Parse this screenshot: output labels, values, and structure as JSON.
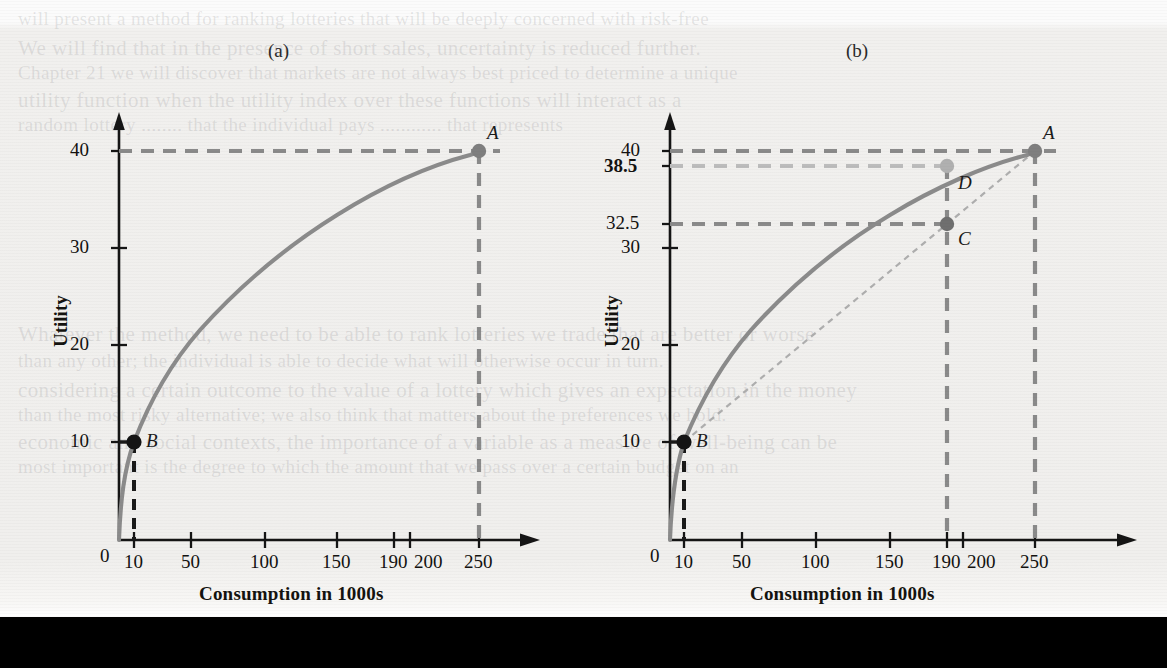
{
  "figure": {
    "background_color": "#f1f0ee",
    "bottom_bar_color": "#000000",
    "ghost_text": [
      {
        "text": "will present a method for ranking lotteries that will be deeply concerned with risk-free",
        "x": 18,
        "y": 8
      },
      {
        "text": "We will find that in the presence of short sales, uncertainty is reduced further.",
        "x": 18,
        "y": 36
      },
      {
        "text": "Chapter 21 we will discover that markets are not always best priced to determine a unique",
        "x": 18,
        "y": 62
      },
      {
        "text": "utility function when the utility index over these functions will interact as a",
        "x": 18,
        "y": 88
      },
      {
        "text": "random lottery  ........  that the individual pays ............ that represents",
        "x": 18,
        "y": 114
      },
      {
        "text": "Whatever the method, we need to be able to rank lotteries we trade that are better or worse",
        "x": 18,
        "y": 322
      },
      {
        "text": "than any other; the individual is able to decide what will otherwise occur in turn.",
        "x": 18,
        "y": 350
      },
      {
        "text": "considering a certain outcome to the value of a lottery which gives an expectation in the money",
        "x": 18,
        "y": 378
      },
      {
        "text": "than the most risky alternative; we also think that matters about the preferences we hold.",
        "x": 18,
        "y": 404
      },
      {
        "text": "economic and social contexts, the importance of a variable as a measure of well-being can be",
        "x": 18,
        "y": 430
      },
      {
        "text": "most important is the degree to which the amount that we pass over a certain budget on an",
        "x": 18,
        "y": 456
      }
    ]
  },
  "chart_data": [
    {
      "type": "line",
      "panel": "(a)",
      "title": "(a)",
      "xlabel": "Consumption in 1000s",
      "ylabel": "Utility",
      "xlim": [
        0,
        275
      ],
      "ylim": [
        0,
        45
      ],
      "grid": false,
      "legend": "none",
      "x_ticks": [
        0,
        10,
        50,
        100,
        150,
        190,
        200,
        250
      ],
      "x_tick_labels": [
        "0",
        "10",
        "50",
        "100",
        "150",
        "190",
        "200",
        "250"
      ],
      "y_ticks": [
        10,
        20,
        30,
        40
      ],
      "y_tick_labels": [
        "10",
        "20",
        "30",
        "40"
      ],
      "curve_color": "#8b8b8b",
      "series": [
        {
          "name": "utility function",
          "x": [
            0,
            2,
            5,
            10,
            20,
            35,
            50,
            75,
            100,
            125,
            150,
            175,
            190,
            200,
            225,
            250
          ],
          "values": [
            0,
            4.5,
            7.2,
            10.0,
            14.3,
            19.0,
            22.5,
            27.0,
            30.4,
            33.2,
            35.4,
            37.3,
            38.3,
            38.9,
            39.6,
            40.0
          ]
        }
      ],
      "points": [
        {
          "label": "B",
          "x": 10,
          "y": 10,
          "color": "#1a1a1a",
          "guides": [
            "horizontal",
            "vertical"
          ],
          "guide_color": "#1a1a1a"
        },
        {
          "label": "A",
          "x": 250,
          "y": 40,
          "color": "#7f7f7f",
          "guides": [
            "horizontal",
            "vertical"
          ],
          "guide_color": "#8a8a8a"
        }
      ],
      "annotations": []
    },
    {
      "type": "line",
      "panel": "(b)",
      "title": "(b)",
      "xlabel": "Consumption in 1000s",
      "ylabel": "Utility",
      "xlim": [
        0,
        275
      ],
      "ylim": [
        0,
        45
      ],
      "grid": false,
      "legend": "none",
      "x_ticks": [
        0,
        10,
        50,
        100,
        150,
        190,
        200,
        250
      ],
      "x_tick_labels": [
        "0",
        "10",
        "50",
        "100",
        "150",
        "190",
        "200",
        "250"
      ],
      "y_ticks": [
        10,
        20,
        30,
        32.5,
        38.5,
        40
      ],
      "y_tick_labels": [
        "10",
        "20",
        "30",
        "32.5",
        "38.5",
        "40"
      ],
      "y_tick_bold": [
        "38.5"
      ],
      "curve_color": "#8b8b8b",
      "series": [
        {
          "name": "utility function",
          "x": [
            0,
            2,
            5,
            10,
            20,
            35,
            50,
            75,
            100,
            125,
            150,
            175,
            190,
            200,
            225,
            250
          ],
          "values": [
            0,
            4.5,
            7.2,
            10.0,
            14.3,
            19.0,
            22.5,
            27.0,
            30.4,
            33.2,
            35.4,
            37.3,
            38.5,
            38.9,
            39.6,
            40.0
          ]
        },
        {
          "name": "chord B to A (expected utility line)",
          "x": [
            10,
            190,
            250
          ],
          "values": [
            10,
            32.5,
            40
          ],
          "style": "dotted",
          "color": "#a9a9a9"
        }
      ],
      "points": [
        {
          "label": "B",
          "x": 10,
          "y": 10,
          "color": "#1a1a1a",
          "guides": [
            "horizontal",
            "vertical"
          ],
          "guide_color": "#1a1a1a"
        },
        {
          "label": "A",
          "x": 250,
          "y": 40,
          "color": "#7f7f7f",
          "guides": [
            "horizontal",
            "vertical"
          ],
          "guide_color": "#8a8a8a"
        },
        {
          "label": "D",
          "x": 190,
          "y": 38.5,
          "color": "#b0b0b0",
          "guides": [
            "horizontal"
          ],
          "guide_color": "#bcbcbc"
        },
        {
          "label": "C",
          "x": 190,
          "y": 32.5,
          "color": "#707070",
          "guides": [
            "horizontal",
            "vertical"
          ],
          "guide_color": "#8a8a8a"
        }
      ],
      "annotations": []
    }
  ]
}
